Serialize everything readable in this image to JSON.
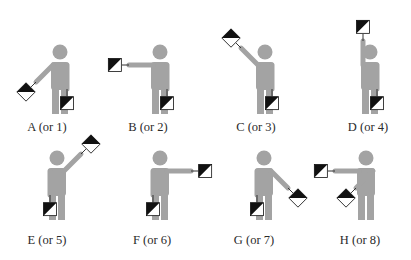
{
  "diagram": {
    "colors": {
      "figure": "#a3a3a3",
      "flag_dark": "#111111",
      "flag_light": "#ffffff",
      "label": "#2a2a2a"
    },
    "signals": [
      {
        "letter": "A",
        "label": "A (or 1)",
        "cx": 60,
        "top": 44,
        "label_x": 47,
        "label_y": 121,
        "left_arm": {
          "angle": 225,
          "flag": "diamond"
        },
        "right_arm": {
          "angle": 180,
          "flag": "square"
        }
      },
      {
        "letter": "B",
        "label": "B (or 2)",
        "cx": 160,
        "top": 44,
        "label_x": 148,
        "label_y": 121,
        "left_arm": {
          "angle": 270,
          "flag": "square"
        },
        "right_arm": {
          "angle": 180,
          "flag": "square"
        }
      },
      {
        "letter": "C",
        "label": "C (or 3)",
        "cx": 265,
        "top": 44,
        "label_x": 256,
        "label_y": 121,
        "left_arm": {
          "angle": 315,
          "flag": "diamond"
        },
        "right_arm": {
          "angle": 180,
          "flag": "square"
        }
      },
      {
        "letter": "D",
        "label": "D (or 4)",
        "cx": 370,
        "top": 44,
        "label_x": 368,
        "label_y": 121,
        "left_arm": {
          "angle": 0,
          "flag": "square"
        },
        "right_arm": {
          "angle": 180,
          "flag": "square"
        }
      },
      {
        "letter": "E",
        "label": "E (or 5)",
        "cx": 57,
        "top": 150,
        "label_x": 47,
        "label_y": 234,
        "left_arm": {
          "angle": 180,
          "flag": "square"
        },
        "right_arm": {
          "angle": 45,
          "flag": "diamond"
        }
      },
      {
        "letter": "F",
        "label": "F (or 6)",
        "cx": 160,
        "top": 150,
        "label_x": 152,
        "label_y": 234,
        "left_arm": {
          "angle": 180,
          "flag": "square"
        },
        "right_arm": {
          "angle": 90,
          "flag": "square"
        }
      },
      {
        "letter": "G",
        "label": "G (or 7)",
        "cx": 264,
        "top": 150,
        "label_x": 254,
        "label_y": 234,
        "left_arm": {
          "angle": 180,
          "flag": "square"
        },
        "right_arm": {
          "angle": 135,
          "flag": "diamond"
        }
      },
      {
        "letter": "H",
        "label": "H (or 8)",
        "cx": 366,
        "top": 150,
        "label_x": 360,
        "label_y": 234,
        "left_arm": {
          "angle": 270,
          "flag": "square"
        },
        "right_arm": {
          "angle": 225,
          "flag": "diamond"
        }
      }
    ]
  }
}
